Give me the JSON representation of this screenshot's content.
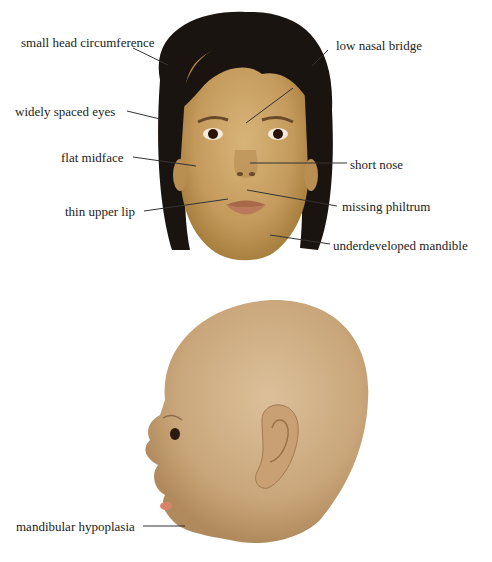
{
  "front_view": {
    "labels": [
      {
        "id": "small-head-circumference",
        "text": "small head circumference",
        "x": 21,
        "y": 35
      },
      {
        "id": "low-nasal-bridge",
        "text": "low nasal bridge",
        "x": 336,
        "y": 38
      },
      {
        "id": "widely-spaced-eyes",
        "text": "widely spaced eyes",
        "x": 15,
        "y": 104
      },
      {
        "id": "flat-midface",
        "text": "flat midface",
        "x": 61,
        "y": 150
      },
      {
        "id": "short-nose",
        "text": "short nose",
        "x": 350,
        "y": 157
      },
      {
        "id": "thin-upper-lip",
        "text": "thin upper lip",
        "x": 65,
        "y": 204
      },
      {
        "id": "missing-philtrum",
        "text": "missing philtrum",
        "x": 342,
        "y": 199
      },
      {
        "id": "underdeveloped-mandible",
        "text": "underdeveloped mandible",
        "x": 333,
        "y": 238
      }
    ]
  },
  "side_view": {
    "labels": [
      {
        "id": "mandibular-hypoplasia",
        "text": "mandibular hypoplasia",
        "x": 16,
        "y": 515
      }
    ]
  },
  "colors": {
    "skin_front": "#c9a265",
    "hair": "#1a1410",
    "skin_side": "#d3b48c",
    "leader_line": "#333333"
  }
}
